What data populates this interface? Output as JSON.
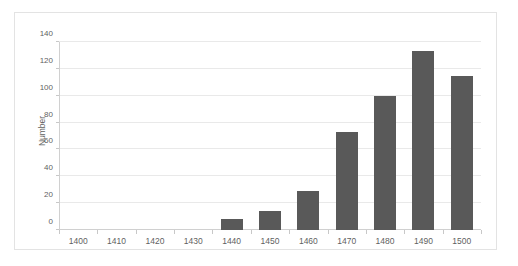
{
  "chart_data": {
    "type": "bar",
    "title": "",
    "subtitle": "",
    "xlabel": "",
    "ylabel": "Number",
    "categories": [
      "1400",
      "1410",
      "1420",
      "1430",
      "1440",
      "1450",
      "1460",
      "1470",
      "1480",
      "1490",
      "1500"
    ],
    "values": [
      0,
      0,
      0,
      0,
      8,
      14,
      29,
      73,
      100,
      133,
      115
    ],
    "series": [
      {
        "name": "Number",
        "values": [
          0,
          0,
          0,
          0,
          8,
          14,
          29,
          73,
          100,
          133,
          115
        ]
      }
    ],
    "ylim": [
      0,
      140
    ],
    "y_ticks": [
      0,
      20,
      40,
      60,
      80,
      100,
      120,
      140
    ],
    "y_tick_labels": [
      "0",
      "20",
      "40",
      "60",
      "80",
      "100",
      "120",
      "140"
    ],
    "grid": true,
    "grid_axis": "y",
    "legend": false,
    "legend_position": "none",
    "bar_color": "#595959",
    "gridline_color": "#e9e9e9",
    "axis_color": "#d0d0d0",
    "border_color": "#e3e3e3",
    "background": "#ffffff",
    "tick_label_color": "#5f5f5f",
    "annotations": []
  }
}
